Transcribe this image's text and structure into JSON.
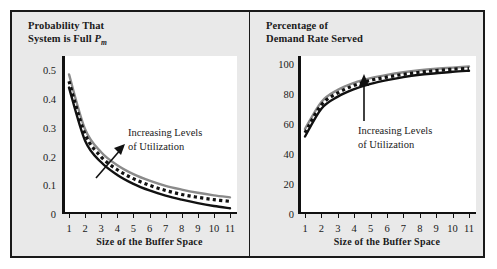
{
  "figure": {
    "background": "#e9e9e9",
    "border_color": "#1a1a1a",
    "panel_bg": "#ffffff"
  },
  "series_style": {
    "low_utilization": {
      "name": "Lower Utilization",
      "color": "#111111",
      "dash": "solid"
    },
    "mid_utilization": {
      "name": "Medium Utilization",
      "color": "#111111",
      "dash": "dotted"
    },
    "high_utilization": {
      "name": "Higher Utilization",
      "color": "#8a8a8a",
      "dash": "solid"
    }
  },
  "chart_data": [
    {
      "type": "line",
      "panel": "left",
      "title": "Probability That System is Full P",
      "title_sub": "m",
      "xlabel": "Size of the Buffer Space",
      "ylabel": "",
      "annotation": [
        "Increasing Levels",
        "of Utilization"
      ],
      "grid": false,
      "legend": "none",
      "x": [
        1,
        2,
        3,
        4,
        5,
        6,
        7,
        8,
        9,
        10,
        11
      ],
      "xlim": [
        1,
        11
      ],
      "ylim": [
        0,
        0.55
      ],
      "xticks": [
        "1",
        "2",
        "3",
        "4",
        "5",
        "6",
        "7",
        "8",
        "9",
        "10",
        "11"
      ],
      "yticks": [
        "0",
        "0.1",
        "0.2",
        "0.3",
        "0.4",
        "0.5"
      ],
      "ytick_values": [
        0,
        0.1,
        0.2,
        0.3,
        0.4,
        0.5
      ],
      "series": [
        {
          "name": "Lower Utilization",
          "color": "#111111",
          "dash": "solid",
          "values": [
            0.44,
            0.255,
            0.18,
            0.136,
            0.105,
            0.082,
            0.064,
            0.05,
            0.038,
            0.028,
            0.02
          ]
        },
        {
          "name": "Medium Utilization",
          "color": "#111111",
          "dash": "dotted",
          "values": [
            0.462,
            0.278,
            0.199,
            0.154,
            0.123,
            0.1,
            0.082,
            0.068,
            0.058,
            0.05,
            0.044
          ]
        },
        {
          "name": "Higher Utilization",
          "color": "#8a8a8a",
          "dash": "solid",
          "values": [
            0.486,
            0.295,
            0.215,
            0.17,
            0.139,
            0.116,
            0.098,
            0.085,
            0.074,
            0.065,
            0.058
          ]
        }
      ]
    },
    {
      "type": "line",
      "panel": "right",
      "title": "Percentage of Demand Rate Served",
      "xlabel": "Size of the Buffer Space",
      "ylabel": "",
      "annotation": [
        "Increasing Levels",
        "of Utilization"
      ],
      "grid": false,
      "legend": "none",
      "x": [
        1,
        2,
        3,
        4,
        5,
        6,
        7,
        8,
        9,
        10,
        11
      ],
      "xlim": [
        1,
        11
      ],
      "ylim": [
        0,
        105
      ],
      "xticks": [
        "1",
        "2",
        "3",
        "4",
        "5",
        "6",
        "7",
        "8",
        "9",
        "10",
        "11"
      ],
      "yticks": [
        "0",
        "20",
        "40",
        "60",
        "80",
        "100"
      ],
      "ytick_values": [
        0,
        20,
        40,
        60,
        80,
        100
      ],
      "series": [
        {
          "name": "Lower Utilization",
          "color": "#111111",
          "dash": "solid",
          "values": [
            51.5,
            70.0,
            78.0,
            83.0,
            86.5,
            89.0,
            91.0,
            92.5,
            93.5,
            94.5,
            95.2
          ]
        },
        {
          "name": "Medium Utilization",
          "color": "#111111",
          "dash": "dotted",
          "values": [
            54.0,
            72.5,
            80.5,
            85.5,
            88.8,
            91.0,
            92.8,
            94.2,
            95.3,
            96.2,
            96.8
          ]
        },
        {
          "name": "Higher Utilization",
          "color": "#8a8a8a",
          "dash": "solid",
          "values": [
            56.5,
            74.5,
            82.5,
            87.2,
            90.3,
            92.5,
            94.2,
            95.5,
            96.5,
            97.3,
            98.0
          ]
        }
      ]
    }
  ]
}
